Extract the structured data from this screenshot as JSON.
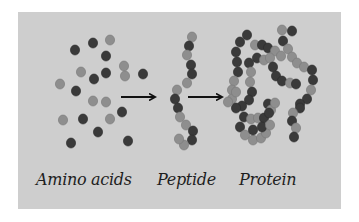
{
  "diagram": {
    "background_color": "#cecece",
    "bead_colors": {
      "dark": "#3a3a3a",
      "light": "#8e8e8e"
    },
    "stages": [
      {
        "id": "amino-acids",
        "label": "Amino acids"
      },
      {
        "id": "peptide",
        "label": "Peptide"
      },
      {
        "id": "protein",
        "label": "Protein"
      }
    ],
    "arrows": [
      {
        "from": "amino-acids",
        "to": "peptide"
      },
      {
        "from": "peptide",
        "to": "protein"
      }
    ],
    "beads": {
      "amino_acids": [
        [
          75,
          50,
          "d"
        ],
        [
          93,
          43,
          "d"
        ],
        [
          110,
          40,
          "l"
        ],
        [
          106,
          56,
          "d"
        ],
        [
          124,
          66,
          "l"
        ],
        [
          125,
          76,
          "l"
        ],
        [
          81,
          72,
          "l"
        ],
        [
          94,
          79,
          "d"
        ],
        [
          106,
          73,
          "d"
        ],
        [
          143,
          74,
          "d"
        ],
        [
          60,
          84,
          "l"
        ],
        [
          76,
          91,
          "d"
        ],
        [
          93,
          101,
          "l"
        ],
        [
          106,
          102,
          "l"
        ],
        [
          122,
          112,
          "d"
        ],
        [
          63,
          120,
          "l"
        ],
        [
          83,
          119,
          "d"
        ],
        [
          110,
          119,
          "l"
        ],
        [
          98,
          132,
          "d"
        ],
        [
          71,
          143,
          "d"
        ],
        [
          128,
          141,
          "d"
        ]
      ],
      "peptide": [
        [
          192,
          37,
          "l"
        ],
        [
          189,
          46,
          "d"
        ],
        [
          187,
          55,
          "l"
        ],
        [
          191,
          65,
          "d"
        ],
        [
          192,
          74,
          "d"
        ],
        [
          187,
          83,
          "l"
        ],
        [
          177,
          90,
          "l"
        ],
        [
          175,
          99,
          "d"
        ],
        [
          178,
          108,
          "d"
        ],
        [
          180,
          117,
          "l"
        ],
        [
          186,
          125,
          "l"
        ],
        [
          193,
          131,
          "d"
        ],
        [
          192,
          140,
          "d"
        ],
        [
          184,
          145,
          "l"
        ],
        [
          179,
          139,
          "l"
        ]
      ],
      "protein": [
        [
          247,
          35,
          "d"
        ],
        [
          240,
          42,
          "d"
        ],
        [
          236,
          52,
          "d"
        ],
        [
          237,
          62,
          "d"
        ],
        [
          238,
          72,
          "d"
        ],
        [
          234,
          81,
          "l"
        ],
        [
          232,
          90,
          "l"
        ],
        [
          255,
          45,
          "l"
        ],
        [
          262,
          45,
          "d"
        ],
        [
          268,
          48,
          "d"
        ],
        [
          275,
          51,
          "l"
        ],
        [
          281,
          56,
          "l"
        ],
        [
          282,
          30,
          "l"
        ],
        [
          292,
          31,
          "d"
        ],
        [
          283,
          41,
          "d"
        ],
        [
          288,
          49,
          "l"
        ],
        [
          292,
          57,
          "l"
        ],
        [
          297,
          63,
          "l"
        ],
        [
          304,
          67,
          "l"
        ],
        [
          312,
          70,
          "d"
        ],
        [
          313,
          80,
          "d"
        ],
        [
          311,
          90,
          "l"
        ],
        [
          307,
          99,
          "d"
        ],
        [
          300,
          104,
          "d"
        ],
        [
          257,
          58,
          "d"
        ],
        [
          264,
          60,
          "l"
        ],
        [
          270,
          58,
          "l"
        ],
        [
          273,
          67,
          "d"
        ],
        [
          276,
          76,
          "d"
        ],
        [
          282,
          81,
          "d"
        ],
        [
          290,
          83,
          "l"
        ],
        [
          296,
          84,
          "d"
        ],
        [
          249,
          63,
          "d"
        ],
        [
          251,
          72,
          "l"
        ],
        [
          250,
          82,
          "l"
        ],
        [
          252,
          92,
          "d"
        ],
        [
          249,
          100,
          "d"
        ],
        [
          242,
          106,
          "d"
        ],
        [
          232,
          99,
          "l"
        ],
        [
          236,
          108,
          "d"
        ],
        [
          268,
          104,
          "d"
        ],
        [
          271,
          110,
          "l"
        ],
        [
          275,
          103,
          "l"
        ],
        [
          300,
          108,
          "d"
        ],
        [
          293,
          113,
          "l"
        ],
        [
          292,
          121,
          "d"
        ],
        [
          296,
          128,
          "l"
        ],
        [
          294,
          137,
          "d"
        ],
        [
          244,
          117,
          "d"
        ],
        [
          251,
          119,
          "l"
        ],
        [
          258,
          118,
          "l"
        ],
        [
          264,
          118,
          "d"
        ],
        [
          269,
          113,
          "d"
        ],
        [
          240,
          127,
          "d"
        ],
        [
          245,
          135,
          "l"
        ],
        [
          253,
          140,
          "l"
        ],
        [
          261,
          138,
          "l"
        ],
        [
          266,
          133,
          "l"
        ],
        [
          253,
          130,
          "d"
        ],
        [
          262,
          127,
          "d"
        ],
        [
          270,
          125,
          "l"
        ],
        [
          236,
          92,
          "l"
        ],
        [
          228,
          102,
          "l"
        ]
      ]
    }
  }
}
